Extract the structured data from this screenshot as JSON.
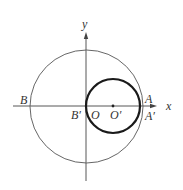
{
  "diagram": {
    "axes": {
      "x_label": "x",
      "y_label": "y",
      "origin": [
        86,
        106
      ],
      "x_range_px": [
        13,
        156
      ],
      "y_range_px": [
        33,
        181
      ]
    },
    "large_circle": {
      "cx": 86.5,
      "cy": 106.5,
      "r": 56.5,
      "stroke": "#555555",
      "stroke_width": 0.9
    },
    "small_circle": {
      "cx": 113,
      "cy": 106,
      "r": 27,
      "stroke": "#1a1a1a",
      "stroke_width": 2.2
    },
    "center_point": {
      "cx": 113,
      "cy": 106,
      "r": 1.4
    },
    "colors": {
      "axis": "#444444",
      "text": "#333333"
    },
    "labels": {
      "B": "B",
      "B_prime": "B′",
      "O": "O",
      "O_prime": "O′",
      "A": "A",
      "A_prime": "A′",
      "x": "x",
      "y": "y"
    }
  }
}
